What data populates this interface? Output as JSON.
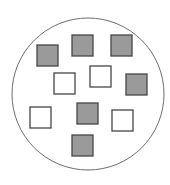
{
  "diagram": {
    "colors": {
      "shaded_fill": "#9a9a9a",
      "unshaded_fill": "#ffffff",
      "square_stroke": "#454545",
      "circle_stroke": "#6e6e6e"
    },
    "counts": {
      "shaded": 6,
      "unshaded": 4,
      "total": 10
    },
    "squares": [
      {
        "id": "s1",
        "shaded": true
      },
      {
        "id": "s2",
        "shaded": true
      },
      {
        "id": "s3",
        "shaded": true
      },
      {
        "id": "s4",
        "shaded": false
      },
      {
        "id": "s5",
        "shaded": false
      },
      {
        "id": "s6",
        "shaded": true
      },
      {
        "id": "s7",
        "shaded": false
      },
      {
        "id": "s8",
        "shaded": true
      },
      {
        "id": "s9",
        "shaded": false
      },
      {
        "id": "s10",
        "shaded": true
      }
    ]
  }
}
